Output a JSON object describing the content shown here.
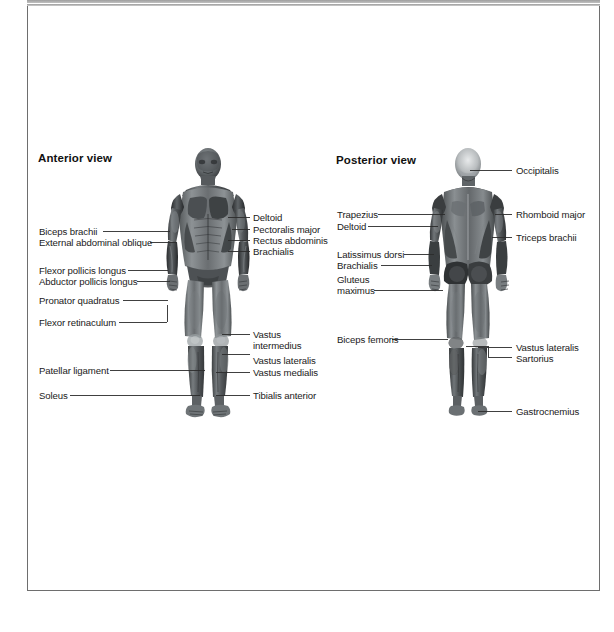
{
  "page": {
    "background_color": "#ffffff",
    "frame_color": "#6e6e6e",
    "text_color": "#1a1a1a"
  },
  "anterior": {
    "title": "Anterior view",
    "labels_left": [
      {
        "text": "Biceps brachii"
      },
      {
        "text": "External abdominal oblique"
      },
      {
        "text": "Flexor pollicis longus"
      },
      {
        "text": "Abductor pollicis longus"
      },
      {
        "text": "Pronator quadratus"
      },
      {
        "text": "Flexor retinaculum"
      },
      {
        "text": "Patellar ligament"
      },
      {
        "text": "Soleus"
      }
    ],
    "labels_right": [
      {
        "text": "Deltoid"
      },
      {
        "text": "Pectoralis major"
      },
      {
        "text": "Rectus abdominis"
      },
      {
        "text": "Brachialis"
      },
      {
        "text": "Vastus"
      },
      {
        "text": "intermedius"
      },
      {
        "text": "Vastus lateralis"
      },
      {
        "text": "Vastus medialis"
      },
      {
        "text": "Tibialis anterior"
      }
    ]
  },
  "posterior": {
    "title": "Posterior view",
    "labels_left": [
      {
        "text": "Trapezius"
      },
      {
        "text": "Deltoid"
      },
      {
        "text": "Latissimus dorsi"
      },
      {
        "text": "Brachialis"
      },
      {
        "text": "Gluteus"
      },
      {
        "text": "maximus"
      },
      {
        "text": "Biceps femoris"
      }
    ],
    "labels_right": [
      {
        "text": "Occipitalis"
      },
      {
        "text": "Rhomboid major"
      },
      {
        "text": "Triceps brachii"
      },
      {
        "text": "Vastus lateralis"
      },
      {
        "text": "Sartorius"
      },
      {
        "text": "Gastrocnemius"
      }
    ]
  },
  "figures": {
    "anterior_alt": "anatomical-figure-anterior",
    "posterior_alt": "anatomical-figure-posterior"
  }
}
